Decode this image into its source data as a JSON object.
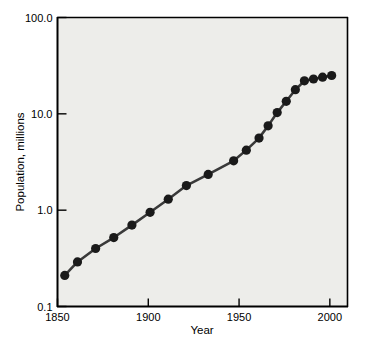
{
  "chart_data": {
    "type": "line",
    "title": "",
    "xlabel": "Year",
    "ylabel": "Population, millions",
    "xlim": [
      1850,
      2010
    ],
    "ylim": [
      0.1,
      100.0
    ],
    "yscale": "log",
    "xscale": "linear",
    "grid": false,
    "legend": null,
    "xticks": [
      1850,
      1900,
      1950,
      2000
    ],
    "xtick_labels": [
      "1850",
      "1900",
      "1950",
      "2000"
    ],
    "yticks": [
      0.1,
      1.0,
      10.0,
      100.0
    ],
    "ytick_labels": [
      "0.1",
      "1.0",
      "10.0",
      "100.0"
    ],
    "series": [
      {
        "name": "Population",
        "marker": "filled-circle",
        "marker_color": "#1a1a1a",
        "line_color": "#3a3a3a",
        "x": [
          1854,
          1861,
          1871,
          1881,
          1891,
          1901,
          1911,
          1921,
          1933,
          1947,
          1954,
          1961,
          1966,
          1971,
          1976,
          1981,
          1986,
          1991,
          1996,
          2001
        ],
        "y": [
          0.21,
          0.29,
          0.4,
          0.52,
          0.7,
          0.95,
          1.3,
          1.8,
          2.35,
          3.25,
          4.2,
          5.6,
          7.5,
          10.3,
          13.5,
          17.8,
          22.0,
          23.0,
          24.0,
          25.0
        ]
      }
    ],
    "plot_background": "#ededea",
    "figure_background": "#ffffff",
    "axis_color": "#000000"
  },
  "figure": {
    "axis_label_x": "Year",
    "axis_label_y": "Population, millions"
  }
}
